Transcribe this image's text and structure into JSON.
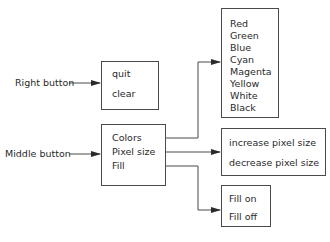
{
  "labels": {
    "right_button": "Right button",
    "middle_button": "Middle button"
  },
  "right_menu": {
    "items": [
      "quit",
      "clear"
    ]
  },
  "middle_menu": {
    "items": [
      "Colors",
      "Pixel size",
      "Fill"
    ]
  },
  "colors_submenu": {
    "items": [
      "Red",
      "Green",
      "Blue",
      "Cyan",
      "Magenta",
      "Yellow",
      "White",
      "Black"
    ]
  },
  "pixel_size_submenu": {
    "items": [
      "increase pixel size",
      "decrease pixel size"
    ]
  },
  "fill_submenu": {
    "items": [
      "Fill on",
      "Fill off"
    ]
  },
  "colors": {
    "line": "#4a4a4a",
    "text": "#2a2a2a",
    "background": "#ffffff"
  }
}
